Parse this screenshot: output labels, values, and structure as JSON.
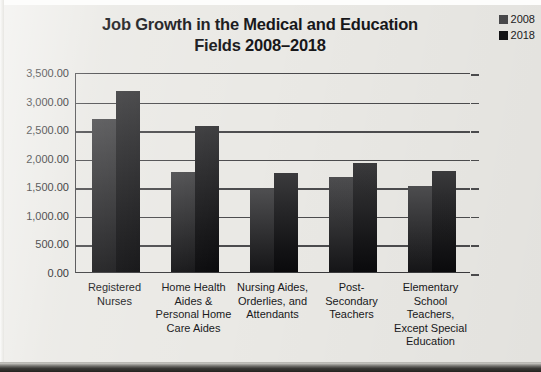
{
  "chart_data": {
    "type": "bar",
    "title": "Job Growth in the Medical and Education Fields 2008–2018",
    "title_line1": "Job Growth in the Medical and Education",
    "title_line2": "Fields 2008–2018",
    "xlabel": "",
    "ylabel": "",
    "ylim": [
      0,
      3500
    ],
    "ytick_step": 500,
    "grid": true,
    "legend_position": "top-right",
    "categories": [
      "Registered Nurses",
      "Home Health Aides & Personal Home Care Aides",
      "Nursing Aides, Orderlies, and Attendants",
      "Post-Secondary Teachers",
      "Elementary School Teachers, Except Special Education"
    ],
    "category_lines": [
      [
        "Registered",
        "Nurses"
      ],
      [
        "Home Health",
        "Aides &",
        "Personal Home",
        "Care Aides"
      ],
      [
        "Nursing Aides,",
        "Orderlies, and",
        "Attendants"
      ],
      [
        "Post-",
        "Secondary",
        "Teachers"
      ],
      [
        "Elementary",
        "School",
        "Teachers,",
        "Except Special",
        "Education"
      ]
    ],
    "series": [
      {
        "name": "2008",
        "color": "#3a3a3c",
        "values": [
          2680,
          1750,
          1430,
          1670,
          1510
        ]
      },
      {
        "name": "2018",
        "color": "#141416",
        "values": [
          3170,
          2560,
          1740,
          1900,
          1760
        ]
      }
    ],
    "ytick_labels": [
      "3,500.00",
      "3,000.00",
      "2,500.00",
      "2,000.00",
      "1,500.00",
      "1,000.00",
      "500.00",
      "0.00"
    ],
    "ytick_values": [
      3500,
      3000,
      2500,
      2000,
      1500,
      1000,
      500,
      0
    ]
  },
  "legend": {
    "items": [
      {
        "label": "2008",
        "color": "#4a4a4c"
      },
      {
        "label": "2018",
        "color": "#131315"
      }
    ]
  },
  "colors": {
    "background": "#eae9e5",
    "axis": "#4a4a4c",
    "text": "#18181a"
  }
}
